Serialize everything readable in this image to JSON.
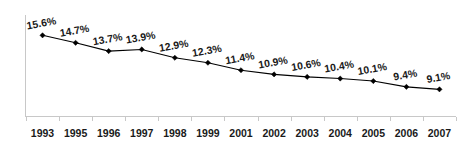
{
  "chart_data": {
    "type": "line",
    "title": "",
    "subtitle": "",
    "xlabel": "",
    "ylabel": "",
    "grid": false,
    "legend": false,
    "legend_position": "none",
    "marker": "diamond",
    "line_color": "#000000",
    "marker_color": "#000000",
    "axis_color": "#c8c8c8",
    "label_color": "#1a1a1a",
    "label_rotation_deg": -10,
    "value_suffix": "%",
    "ylim": [
      0,
      17
    ],
    "categories": [
      "1993",
      "1995",
      "1996",
      "1997",
      "1998",
      "1999",
      "2001",
      "2002",
      "2003",
      "2004",
      "2005",
      "2006",
      "2007"
    ],
    "values": [
      15.6,
      14.7,
      13.7,
      13.9,
      12.9,
      12.3,
      11.4,
      10.9,
      10.6,
      10.4,
      10.1,
      9.4,
      9.1
    ],
    "point_labels": [
      "15.6%",
      "14.7%",
      "13.7%",
      "13.9%",
      "12.9%",
      "12.3%",
      "11.4%",
      "10.9%",
      "10.6%",
      "10.4%",
      "10.1%",
      "9.4%",
      "9.1%"
    ],
    "series": [
      {
        "name": "",
        "values": [
          15.6,
          14.7,
          13.7,
          13.9,
          12.9,
          12.3,
          11.4,
          10.9,
          10.6,
          10.4,
          10.1,
          9.4,
          9.1
        ]
      }
    ]
  }
}
